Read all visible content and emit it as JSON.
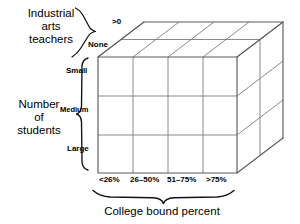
{
  "figure": {
    "type": "3d-factorial-design-cube",
    "colors": {
      "outline": "#5c5c5c",
      "gridline": "#7d7d7d",
      "brace": "#111111",
      "text": "#000000",
      "background": "#ffffff"
    },
    "axes": {
      "depth": {
        "title": "Industrial\narts\nteachers",
        "title_line1": "Industrial",
        "title_line2": "arts",
        "title_line3": "teachers",
        "levels": [
          {
            "label": "None"
          },
          {
            "label": ">0"
          }
        ]
      },
      "vertical": {
        "title_line1": "Number",
        "title_line2": "of",
        "title_line3": "students",
        "levels": [
          {
            "label": "Small"
          },
          {
            "label": "Medium"
          },
          {
            "label": "Large"
          }
        ]
      },
      "horizontal": {
        "title": "College bound percent",
        "levels": [
          {
            "label": "<26%"
          },
          {
            "label": "26–50%"
          },
          {
            "label": "51–75%"
          },
          {
            "label": ">75%"
          }
        ]
      }
    },
    "cells": {
      "columns": 4,
      "rows": 3,
      "depth": 2,
      "total": 24
    }
  }
}
